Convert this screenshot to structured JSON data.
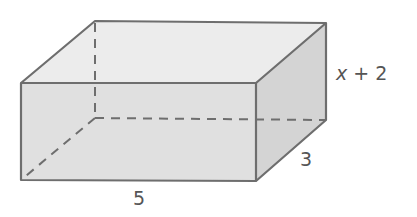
{
  "figure": {
    "type": "rectangular-prism",
    "labels": {
      "height": "x + 2",
      "height_var": "x",
      "height_rest": " + 2",
      "depth": "3",
      "width": "5"
    },
    "colors": {
      "edge": "#6e6e6e",
      "top_face": "#ececec",
      "front_face": "#e0e0e0",
      "side_face": "#d2d2d2",
      "label": "#555555"
    }
  }
}
